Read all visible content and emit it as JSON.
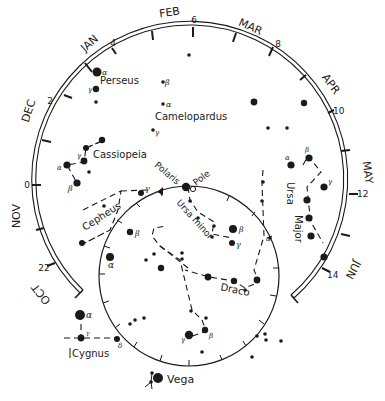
{
  "months": [
    {
      "label": "JAN",
      "x": 92,
      "y": 46,
      "rot": -42
    },
    {
      "label": "FEB",
      "x": 170,
      "y": 16,
      "rot": -8
    },
    {
      "label": "MAR",
      "x": 245,
      "y": 30,
      "rot": 22
    },
    {
      "label": "APR",
      "x": 325,
      "y": 85,
      "rot": 52
    },
    {
      "label": "MAY",
      "x": 364,
      "y": 173,
      "rot": 80
    },
    {
      "label": "JUN",
      "x": 350,
      "y": 270,
      "rot": 118
    },
    {
      "label": "DEC",
      "x": 27,
      "y": 112,
      "rot": -72
    },
    {
      "label": "NOV",
      "x": 14,
      "y": 214,
      "rot": -90
    },
    {
      "label": "OCT",
      "x": 45,
      "y": 295,
      "rot": -128
    }
  ],
  "hour_labels": [
    {
      "label": "4",
      "x": 112,
      "y": 46
    },
    {
      "label": "6",
      "x": 194,
      "y": 23
    },
    {
      "label": "8",
      "x": 276,
      "y": 48
    },
    {
      "label": "10",
      "x": 336,
      "y": 113
    },
    {
      "label": "12",
      "x": 356,
      "y": 197
    },
    {
      "label": "14",
      "x": 330,
      "y": 278
    },
    {
      "label": "2",
      "x": 48,
      "y": 104
    },
    {
      "label": "0",
      "x": 27,
      "y": 187
    },
    {
      "label": "22",
      "x": 44,
      "y": 270
    }
  ],
  "constellations": [
    {
      "label": "Perseus",
      "x": 100,
      "y": 84,
      "rot": 0
    },
    {
      "label": "Camelopardus",
      "x": 155,
      "y": 120,
      "rot": 0
    },
    {
      "label": "Cassiopeia",
      "x": 93,
      "y": 158,
      "rot": 0
    },
    {
      "label": "Cepheus",
      "x": 86,
      "y": 228,
      "rot": -32
    },
    {
      "label": "Ursa minor",
      "x": 200,
      "y": 203,
      "rot": 48
    },
    {
      "label": "Ursa",
      "x": 287,
      "y": 182,
      "rot": 90
    },
    {
      "label": "Major",
      "x": 292,
      "y": 222,
      "rot": 90
    },
    {
      "label": "Draco",
      "x": 220,
      "y": 292,
      "rot": 12
    },
    {
      "label": "Cygnus",
      "x": 82,
      "y": 357,
      "rot": 0
    },
    {
      "label": "Vega",
      "x": 166,
      "y": 385,
      "rot": 0
    }
  ],
  "markers": [
    {
      "label": "Polaris",
      "x": 155,
      "y": 168,
      "rot": 40
    },
    {
      "label": "Pole",
      "x": 193,
      "y": 186,
      "rot": -38
    }
  ]
}
